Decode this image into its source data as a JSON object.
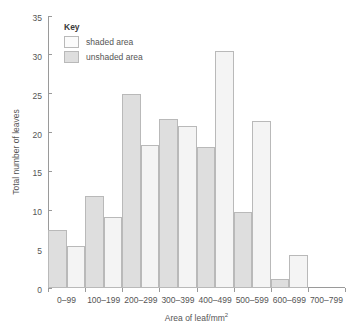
{
  "chart_data": {
    "type": "bar",
    "title": "",
    "xlabel": "Area of leaf/mm²",
    "xlabel_base": "Area of leaf/mm",
    "xlabel_sup": "2",
    "ylabel": "Total number of leaves",
    "ylim": [
      0,
      35
    ],
    "yticks": [
      0,
      5,
      10,
      15,
      20,
      25,
      30,
      35
    ],
    "grid": false,
    "legend_title": "Key",
    "legend_position": "top-left-inside",
    "categories": [
      "0–99",
      "100–199",
      "200–299",
      "300–399",
      "400–499",
      "500–599",
      "600–699",
      "700–799"
    ],
    "series": [
      {
        "name": "unshaded area",
        "color": "#dedede",
        "values": [
          7.5,
          11.8,
          25.0,
          21.8,
          18.2,
          9.8,
          1.1,
          0
        ]
      },
      {
        "name": "shaded area",
        "color": "#f4f4f4",
        "values": [
          5.4,
          9.2,
          18.4,
          20.8,
          30.5,
          21.5,
          4.2,
          0
        ]
      }
    ],
    "series_order_in_group": [
      "unshaded area",
      "shaded area"
    ]
  },
  "legend": {
    "title": "Key",
    "items": [
      {
        "label": "shaded area",
        "swatch": "shaded"
      },
      {
        "label": "unshaded area",
        "swatch": "unshaded"
      }
    ]
  },
  "colors": {
    "unshaded_fill": "#dedede",
    "shaded_fill": "#f4f4f4",
    "bar_stroke": "#b9b9b9",
    "axis": "#9a9a9a",
    "text": "#555555"
  }
}
